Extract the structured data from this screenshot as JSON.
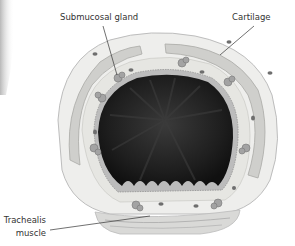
{
  "diagram": {
    "labels": [
      {
        "id": "submucosal-gland",
        "text": "Submucosal gland",
        "x": 60,
        "y": 13,
        "line": [
          103,
          26,
          117,
          75
        ]
      },
      {
        "id": "cartilage",
        "text": "Cartilage",
        "x": 232,
        "y": 13,
        "line": [
          254,
          26,
          220,
          55
        ]
      },
      {
        "id": "trachealis-muscle-line1",
        "text": "Trachealis",
        "x": 2,
        "y": 218
      },
      {
        "id": "trachealis-muscle-line2",
        "text": "muscle",
        "x": 14,
        "y": 231
      }
    ],
    "trachealis_line": [
      50,
      230,
      150,
      216
    ],
    "colors": {
      "lumen": "#1c1c1c",
      "mucosa": "#b9b9b9",
      "submucosa": "#e4e4e0",
      "cartilage": "#c9c9c6",
      "adventitia": "#ededeb",
      "gland": "#9a9a9a",
      "line": "#333333"
    }
  }
}
